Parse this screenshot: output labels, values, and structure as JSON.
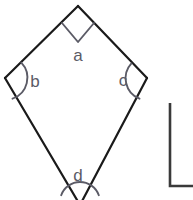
{
  "figure": {
    "type": "geometry-diagram",
    "background_color": "#ffffff",
    "edge_color": "#1a1a1a",
    "marker_color": "#5b5b66",
    "label_color": "#5b5b66",
    "edge_width": 2.2,
    "marker_width": 1.8,
    "shapes": [
      {
        "name": "kite",
        "kind": "polygon",
        "closed": true,
        "clipped_at_bottom": true,
        "vertices": [
          {
            "id": "top",
            "x": 78,
            "y": 6,
            "angle_label": "a"
          },
          {
            "id": "left",
            "x": 5,
            "y": 78,
            "angle_label": "b"
          },
          {
            "id": "bottom",
            "x": 80,
            "y": 202,
            "angle_label": "d"
          },
          {
            "id": "right",
            "x": 147,
            "y": 78,
            "angle_label": "c"
          }
        ]
      },
      {
        "name": "partial-corner",
        "kind": "polyline",
        "description": "right angle corner of an adjacent figure, clipped by the frame",
        "points": [
          {
            "x": 170,
            "y": 103
          },
          {
            "x": 170,
            "y": 186
          },
          {
            "x": 195,
            "y": 186
          }
        ]
      }
    ],
    "angle_markers": [
      {
        "for_vertex": "top",
        "marker_type": "right-angle-square",
        "label": "a",
        "label_x": 78,
        "label_y": 61,
        "square_points": [
          {
            "x": 62,
            "y": 23
          },
          {
            "x": 78,
            "y": 42
          },
          {
            "x": 94,
            "y": 23
          }
        ]
      },
      {
        "for_vertex": "left",
        "marker_type": "arc",
        "label": "b",
        "label_x": 35,
        "label_y": 87,
        "arc": {
          "cx": 5,
          "cy": 78,
          "r": 22,
          "start_deg": -44,
          "end_deg": 70
        }
      },
      {
        "for_vertex": "right",
        "marker_type": "arc",
        "label": "c",
        "label_x": 123,
        "label_y": 86,
        "arc": {
          "cx": 147,
          "cy": 78,
          "r": 22,
          "start_deg": 110,
          "end_deg": 228
        }
      },
      {
        "for_vertex": "bottom",
        "marker_type": "arc",
        "label": "d",
        "label_x": 78,
        "label_y": 181,
        "arc": {
          "cx": 80,
          "cy": 202,
          "r": 20,
          "start_deg": 200,
          "end_deg": 340
        }
      }
    ],
    "labels": [
      {
        "id": "label-a",
        "text": "a"
      },
      {
        "id": "label-b",
        "text": "b"
      },
      {
        "id": "label-c",
        "text": "c"
      },
      {
        "id": "label-d",
        "text": "d"
      }
    ]
  }
}
